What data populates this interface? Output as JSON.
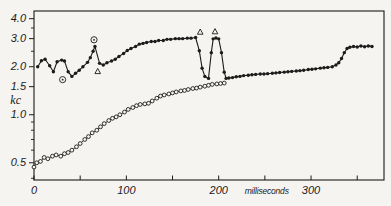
{
  "figure": {
    "background": "#f5f4f1",
    "ink": "#1b1b1b"
  },
  "chart_data": {
    "type": "line",
    "title": "",
    "xlabel": "milliseconds",
    "ylabel": "kc",
    "legend": "none",
    "grid": false,
    "x_axis": {
      "min": 0,
      "max": 379,
      "tick_values": [
        0,
        50,
        100,
        150,
        200,
        250,
        300,
        350
      ],
      "labels": [
        {
          "x": 0,
          "text": "0"
        },
        {
          "x": 100,
          "text": "100"
        },
        {
          "x": 200,
          "text": "200"
        },
        {
          "x": 252,
          "text": "milliseconds",
          "unit": true
        },
        {
          "x": 300,
          "text": "300"
        }
      ]
    },
    "y_axis": {
      "scale": "log",
      "min": 0.39,
      "max": 4.47,
      "unit_label": "kc",
      "major_ticks": [
        4.0,
        3.0,
        2.0,
        1.5,
        1.0,
        0.5
      ],
      "minor_ticks": [
        3.5,
        2.5,
        0.9,
        0.8,
        0.7,
        0.6,
        0.4
      ],
      "labels": [
        {
          "v": 4.0,
          "text": "4.0"
        },
        {
          "v": 3.0,
          "text": "3.0"
        },
        {
          "v": 2.0,
          "text": "2.0"
        },
        {
          "v": 1.5,
          "text": "1.5"
        },
        {
          "v": 1.0,
          "text": "1.0"
        },
        {
          "v": 0.5,
          "text": "0.5"
        }
      ]
    },
    "series": [
      {
        "name": "open-circle-trace",
        "marker": "open-circle",
        "points": [
          [
            0,
            0.47
          ],
          [
            3,
            0.5
          ],
          [
            7,
            0.51
          ],
          [
            11,
            0.54
          ],
          [
            15,
            0.53
          ],
          [
            20,
            0.55
          ],
          [
            24,
            0.56
          ],
          [
            29,
            0.55
          ],
          [
            33,
            0.57
          ],
          [
            37,
            0.58
          ],
          [
            41,
            0.6
          ],
          [
            46,
            0.63
          ],
          [
            50,
            0.66
          ],
          [
            55,
            0.7
          ],
          [
            59,
            0.73
          ],
          [
            63,
            0.77
          ],
          [
            68,
            0.8
          ],
          [
            72,
            0.84
          ],
          [
            76,
            0.88
          ],
          [
            81,
            0.92
          ],
          [
            85,
            0.95
          ],
          [
            89,
            0.97
          ],
          [
            93,
            1.0
          ],
          [
            98,
            1.04
          ],
          [
            102,
            1.08
          ],
          [
            107,
            1.11
          ],
          [
            111,
            1.14
          ],
          [
            115,
            1.16
          ],
          [
            120,
            1.17
          ],
          [
            124,
            1.18
          ],
          [
            128,
            1.22
          ],
          [
            133,
            1.27
          ],
          [
            137,
            1.31
          ],
          [
            141,
            1.33
          ],
          [
            146,
            1.35
          ],
          [
            150,
            1.37
          ],
          [
            154,
            1.39
          ],
          [
            159,
            1.41
          ],
          [
            163,
            1.42
          ],
          [
            167,
            1.44
          ],
          [
            172,
            1.46
          ],
          [
            176,
            1.47
          ],
          [
            180,
            1.49
          ],
          [
            185,
            1.51
          ],
          [
            189,
            1.53
          ],
          [
            193,
            1.55
          ],
          [
            198,
            1.56
          ],
          [
            202,
            1.57
          ],
          [
            206,
            1.58
          ]
        ]
      },
      {
        "name": "filled-circle-trace",
        "marker": "filled-circle",
        "points": [
          [
            4,
            2.0
          ],
          [
            8,
            2.18
          ],
          [
            12,
            2.23
          ],
          [
            17,
            2.03
          ],
          [
            21,
            1.86
          ],
          [
            25,
            2.15
          ],
          [
            30,
            2.2
          ],
          [
            33,
            2.17
          ],
          [
            37,
            1.86
          ],
          [
            41,
            1.74
          ],
          [
            45,
            1.82
          ],
          [
            49,
            1.9
          ],
          [
            53,
            2.0
          ],
          [
            58,
            2.13
          ],
          [
            61,
            2.28
          ],
          [
            64,
            2.5
          ],
          [
            66,
            2.68
          ],
          [
            71,
            2.1
          ],
          [
            75,
            2.05
          ],
          [
            79,
            2.12
          ],
          [
            84,
            2.17
          ],
          [
            88,
            2.23
          ],
          [
            92,
            2.32
          ],
          [
            97,
            2.42
          ],
          [
            101,
            2.53
          ],
          [
            105,
            2.6
          ],
          [
            110,
            2.68
          ],
          [
            114,
            2.77
          ],
          [
            118,
            2.8
          ],
          [
            122,
            2.84
          ],
          [
            127,
            2.88
          ],
          [
            131,
            2.88
          ],
          [
            135,
            2.92
          ],
          [
            140,
            2.92
          ],
          [
            144,
            2.97
          ],
          [
            148,
            2.97
          ],
          [
            153,
            3.0
          ],
          [
            157,
            3.0
          ],
          [
            161,
            3.0
          ],
          [
            166,
            3.02
          ],
          [
            170,
            3.02
          ],
          [
            175,
            3.05
          ],
          [
            179,
            2.52
          ],
          [
            182,
            1.96
          ],
          [
            185,
            1.74
          ],
          [
            189,
            1.69
          ],
          [
            192,
            2.45
          ],
          [
            194,
            2.99
          ],
          [
            197,
            3.03
          ],
          [
            200,
            2.99
          ],
          [
            203,
            2.45
          ],
          [
            206,
            1.85
          ],
          [
            208,
            1.69
          ],
          [
            211,
            1.7
          ],
          [
            215,
            1.71
          ],
          [
            219,
            1.73
          ],
          [
            223,
            1.74
          ],
          [
            227,
            1.76
          ],
          [
            232,
            1.77
          ],
          [
            236,
            1.78
          ],
          [
            240,
            1.79
          ],
          [
            245,
            1.8
          ],
          [
            249,
            1.8
          ],
          [
            253,
            1.81
          ],
          [
            258,
            1.82
          ],
          [
            262,
            1.83
          ],
          [
            266,
            1.84
          ],
          [
            271,
            1.85
          ],
          [
            275,
            1.86
          ],
          [
            279,
            1.87
          ],
          [
            284,
            1.88
          ],
          [
            288,
            1.89
          ],
          [
            292,
            1.9
          ],
          [
            297,
            1.92
          ],
          [
            301,
            1.93
          ],
          [
            305,
            1.94
          ],
          [
            310,
            1.96
          ],
          [
            314,
            1.97
          ],
          [
            318,
            1.98
          ],
          [
            323,
            2.0
          ],
          [
            327,
            2.05
          ],
          [
            330,
            2.12
          ],
          [
            333,
            2.25
          ],
          [
            336,
            2.45
          ],
          [
            339,
            2.6
          ],
          [
            342,
            2.65
          ],
          [
            346,
            2.68
          ],
          [
            350,
            2.66
          ],
          [
            354,
            2.7
          ],
          [
            358,
            2.67
          ],
          [
            362,
            2.7
          ],
          [
            366,
            2.68
          ]
        ]
      }
    ],
    "annotations": [
      {
        "symbol": "circle-dot",
        "x": 31,
        "y": 1.66
      },
      {
        "symbol": "circle-dot",
        "x": 65,
        "y": 2.95
      },
      {
        "symbol": "triangle",
        "x": 69,
        "y": 1.87
      },
      {
        "symbol": "triangle",
        "x": 180,
        "y": 3.3
      },
      {
        "symbol": "triangle",
        "x": 196,
        "y": 3.32
      }
    ]
  }
}
